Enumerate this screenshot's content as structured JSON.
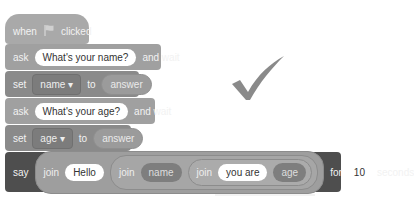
{
  "script": {
    "hat": {
      "when": "when",
      "flag_icon": "green-flag-icon",
      "clicked": "clicked"
    },
    "ask1": {
      "label": "ask",
      "input": "What's your name?",
      "suffix": "and wait"
    },
    "set1": {
      "label": "set",
      "variable": "name ▾",
      "to": "to",
      "value": "answer"
    },
    "ask2": {
      "label": "ask",
      "input": "What's your age?",
      "suffix": "and wait"
    },
    "set2": {
      "label": "set",
      "variable": "age ▾",
      "to": "to",
      "value": "answer"
    },
    "say": {
      "label": "say",
      "join1": {
        "label": "join",
        "text": "Hello"
      },
      "join2": {
        "label": "join",
        "var": "name"
      },
      "join3": {
        "label": "join",
        "text": "you are",
        "var": "age"
      },
      "for": "for",
      "seconds_value": "10",
      "seconds": "seconds"
    }
  },
  "status": {
    "icon": "checkmark-icon"
  },
  "colors": {
    "block_light": "#a0a0a0",
    "block_dark": "#4e4e4e",
    "checkmark": "#8a8a8a"
  }
}
